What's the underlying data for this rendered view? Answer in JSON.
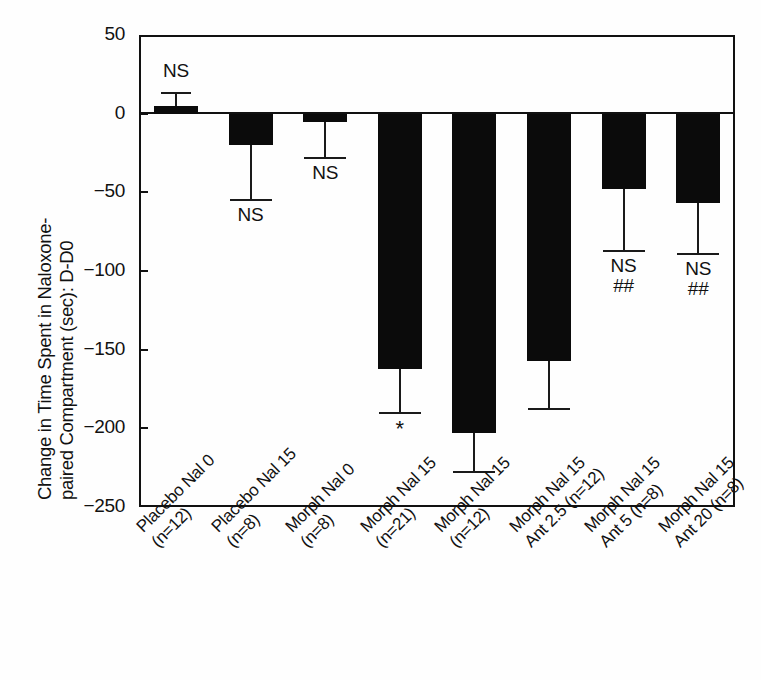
{
  "chart_data": {
    "type": "bar",
    "title": "",
    "subtitle": "",
    "xlabel": "",
    "ylabel": "Change in Time Spent in Naloxone-\npaired Compartment (sec): D-D0",
    "ylabel_line1": "Change in Time Spent in Naloxone-",
    "ylabel_line2": "paired Compartment (sec): D-D0",
    "ylim": [
      -250,
      50
    ],
    "yticks": [
      50,
      0,
      -50,
      -100,
      -150,
      -200,
      -250
    ],
    "ytick_labels": [
      "50",
      "0",
      "−50",
      "−100",
      "−150",
      "−200",
      "−250"
    ],
    "grid": false,
    "legend": "none",
    "orientation": "vertical",
    "error_bars": "one-sided (SEM)",
    "categories": [
      "Placebo Nal 0\n(n=12)",
      "Placebo Nal 15\n(n=8)",
      "Morph Nal 0\n(n=8)",
      "Morph Nal 15\n(n=21)",
      "Morph Nal 15\n(n=12)",
      "Morph Nal 15\nAnt 2.5 (n=12)",
      "Morph Nal 15\nAnt 5 (n=8)",
      "Morph Nal 15\nAnt 20 (n=8)"
    ],
    "values": [
      5,
      -20,
      -5,
      -162,
      -203,
      -157,
      -48,
      -57
    ],
    "error_extent": [
      13,
      -55,
      -28,
      -190,
      -228,
      -188,
      -87,
      -89
    ],
    "annotations": [
      "NS",
      "NS",
      "NS",
      "*",
      "",
      "",
      "NS\n##",
      "NS\n##"
    ],
    "bar_color": "#0b0b0b",
    "axis_color": "#111111",
    "significance_key": {
      "NS": "not significant",
      "*": "significant vs control",
      "##": "significant vs Morph Nal 15"
    }
  },
  "bars": [
    {
      "label_line1": "Placebo Nal 0",
      "label_line2": "(n=12)",
      "value": 5,
      "error_to": 13,
      "ann": "NS",
      "ann_pos": "above"
    },
    {
      "label_line1": "Placebo Nal 15",
      "label_line2": "(n=8)",
      "value": -20,
      "error_to": -55,
      "ann": "NS",
      "ann_pos": "below"
    },
    {
      "label_line1": "Morph Nal 0",
      "label_line2": "(n=8)",
      "value": -5,
      "error_to": -28,
      "ann": "NS",
      "ann_pos": "below"
    },
    {
      "label_line1": "Morph Nal 15",
      "label_line2": "(n=21)",
      "value": -162,
      "error_to": -190,
      "ann": "*",
      "ann_pos": "below"
    },
    {
      "label_line1": "Morph Nal 15",
      "label_line2": "(n=12)",
      "value": -203,
      "error_to": -228,
      "ann": "",
      "ann_pos": "below"
    },
    {
      "label_line1": "Morph Nal 15",
      "label_line2": "Ant 2.5 (n=12)",
      "value": -157,
      "error_to": -188,
      "ann": "",
      "ann_pos": "below"
    },
    {
      "label_line1": "Morph Nal 15",
      "label_line2": "Ant 5 (n=8)",
      "value": -48,
      "error_to": -87,
      "ann": "NS\n##",
      "ann_pos": "below"
    },
    {
      "label_line1": "Morph Nal 15",
      "label_line2": "Ant 20 (n=8)",
      "value": -57,
      "error_to": -89,
      "ann": "NS\n##",
      "ann_pos": "below"
    }
  ]
}
